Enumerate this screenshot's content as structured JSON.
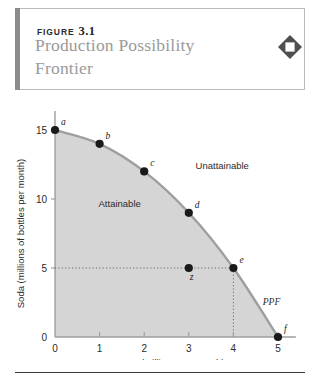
{
  "figure": {
    "eyebrow_word": "FIGURE",
    "eyebrow_number": "3.1",
    "title": "Production Possibility Frontier",
    "icon": "diamond-icon",
    "colors": {
      "title_gray": "#9a9a9a",
      "rule_dark": "#3a3a3a",
      "leftbar_gray": "#8c8c8c",
      "box_border": "#b9b9b9",
      "fill_gray": "#d5d5d5",
      "curve_gray": "#9e9e9e",
      "axis_gray": "#9e9e9e",
      "point_black": "#1a1a1a"
    }
  },
  "chart_data": {
    "type": "line",
    "title": "Production Possibility Frontier",
    "xlabel": "Tapes (millions per month)",
    "ylabel": "Soda (millions of bottles per month)",
    "xlim": [
      0,
      5.4
    ],
    "ylim": [
      0,
      16.3
    ],
    "xticks": [
      0,
      1,
      2,
      3,
      4,
      5
    ],
    "xtick_labels": [
      "0",
      "1",
      "2",
      "3",
      "4",
      "5"
    ],
    "yticks": [
      0,
      5,
      10,
      15
    ],
    "ytick_labels": [
      "0",
      "5",
      "10",
      "15"
    ],
    "grid": false,
    "legend": "none",
    "series": [
      {
        "name": "PPF",
        "label": "PPF",
        "points": [
          {
            "label": "a",
            "x": 0,
            "y": 15
          },
          {
            "label": "b",
            "x": 1,
            "y": 14
          },
          {
            "label": "c",
            "x": 2,
            "y": 12
          },
          {
            "label": "d",
            "x": 3,
            "y": 9
          },
          {
            "label": "e",
            "x": 4,
            "y": 5
          },
          {
            "label": "f",
            "x": 5,
            "y": 0
          }
        ]
      }
    ],
    "interior_points": [
      {
        "label": "z",
        "x": 3,
        "y": 5
      }
    ],
    "annotations": [
      {
        "text": "Unattainable",
        "x": 3.75,
        "y": 12.2
      },
      {
        "text": "Attainable",
        "x": 1.45,
        "y": 9.4
      },
      {
        "text": "PPF",
        "x": 5.05,
        "y": 2.35
      }
    ],
    "guide_lines": [
      {
        "from": [
          0,
          5
        ],
        "to": [
          4,
          5
        ],
        "style": "dotted"
      },
      {
        "from": [
          4,
          5
        ],
        "to": [
          4,
          0
        ],
        "style": "dotted"
      }
    ]
  }
}
